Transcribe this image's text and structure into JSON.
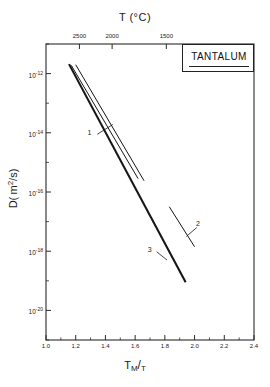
{
  "chart_data": {
    "type": "line",
    "title": "",
    "material_label": "TANTALUM",
    "xlabel": "T_M/T",
    "xlabel_parts": {
      "main": "T",
      "sub": "M",
      "slash": "/",
      "denom": "T"
    },
    "ylabel": "D (m2/s)",
    "ylabel_parts": {
      "symbol": "D",
      "open": "( m",
      "sup": "2",
      "div": "/s",
      "close": ")"
    },
    "top_axis_label": "T (°C)",
    "xlim": [
      1.0,
      2.4
    ],
    "xticks": [
      "1.0",
      "1.2",
      "1.4",
      "1.6",
      "1.8",
      "2.0",
      "2.2",
      "2.4"
    ],
    "xtick_values": [
      1.0,
      1.2,
      1.4,
      1.6,
      1.8,
      2.0,
      2.2,
      2.4
    ],
    "ylim_exponent": [
      -21,
      -11
    ],
    "yticks": [
      "10-12",
      "10-14",
      "10-16",
      "10-18",
      "10-20"
    ],
    "ytick_exponents": [
      -12,
      -14,
      -16,
      -18,
      -20
    ],
    "ytick_mantissa": "10",
    "ytick_labels": [
      {
        "base": "10",
        "exp": "-12"
      },
      {
        "base": "10",
        "exp": "-14"
      },
      {
        "base": "10",
        "exp": "-16"
      },
      {
        "base": "10",
        "exp": "-18"
      },
      {
        "base": "10",
        "exp": "-20"
      }
    ],
    "top_axis_ticks": [
      "2500",
      "2000",
      "1500"
    ],
    "top_axis_tick_values": [
      2500,
      2000,
      1500
    ],
    "top_axis_tick_x": [
      1.225,
      1.445,
      1.81
    ],
    "grid": false,
    "legend_position": "top-right",
    "series": [
      {
        "name": "1",
        "label": "1",
        "comment": "upper thin line, short segment",
        "points": [
          [
            1.17,
            -11.72
          ],
          [
            1.62,
            -15.55
          ]
        ]
      },
      {
        "name": "1b",
        "label": "",
        "comment": "second thin line parallel to 1",
        "points": [
          [
            1.2,
            -11.7
          ],
          [
            1.66,
            -15.62
          ]
        ]
      },
      {
        "name": "3",
        "label": "3",
        "comment": "main thick line spanning full range",
        "points": [
          [
            1.155,
            -11.68
          ],
          [
            1.94,
            -19.05
          ]
        ]
      },
      {
        "name": "2",
        "label": "2",
        "comment": "short isolated segment at right",
        "points": [
          [
            1.83,
            -16.5
          ],
          [
            2.0,
            -17.85
          ]
        ]
      }
    ],
    "annotations": [
      {
        "label": "1",
        "x": 1.3,
        "y": -14.05
      },
      {
        "label": "2",
        "x": 2.03,
        "y": -17.12
      },
      {
        "label": "3",
        "x": 1.705,
        "y": -18.0
      }
    ]
  }
}
